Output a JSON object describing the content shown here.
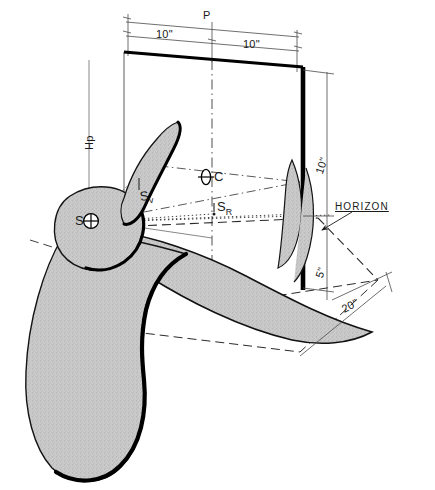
{
  "diagram": {
    "type": "technical-perspective-drawing",
    "colors": {
      "ink": "#1a1a1a",
      "form_fill": "#c8c8c8",
      "form_edge_heavy": "#000000",
      "plane_edge": "#000000",
      "thin_rule": "#4a4a4a",
      "background": "#ffffff"
    }
  },
  "dimensions": {
    "picture_plane_width_label": "P",
    "left_half_width": "10\"",
    "right_half_width": "10\"",
    "picture_plane_height_upper": "10\"",
    "picture_plane_height_lower": "5\"",
    "ground_depth": "20\"",
    "height_of_point": "Hp"
  },
  "markers": {
    "station_point": {
      "label": "S",
      "symbol": "crossed-circle"
    },
    "center_of_vision": {
      "label": "C",
      "symbol": "crossed-ellipse"
    },
    "station_vertical": {
      "label": "S",
      "subscript": "v"
    },
    "station_right": {
      "label": "S",
      "subscript": "R"
    }
  },
  "annotations": {
    "horizon_label": "HORIZON"
  }
}
